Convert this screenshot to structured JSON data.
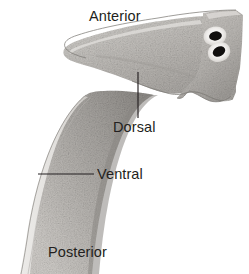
{
  "figure": {
    "name": "flatworm-orientation-diagram",
    "background_color": "#ffffff",
    "width": 249,
    "height": 274
  },
  "labels": {
    "anterior": "Anterior",
    "dorsal": "Dorsal",
    "ventral": "Ventral",
    "posterior": "Posterior"
  },
  "leader_lines": {
    "dorsal": "vertical",
    "ventral": "horizontal"
  },
  "colors": {
    "text": "#231f20",
    "leader_line": "#231f20",
    "body_light": "#d9d7d4",
    "body_mid": "#b3b0ac",
    "body_dark": "#8d8a86",
    "outline": "#6e6b68",
    "eyespot": "#100f0e",
    "eyespot_halo": "#f4f3f1"
  },
  "anatomy": {
    "eyespots_count": 2,
    "eyespot_labels": [
      "eyespot-upper",
      "eyespot-lower"
    ]
  }
}
